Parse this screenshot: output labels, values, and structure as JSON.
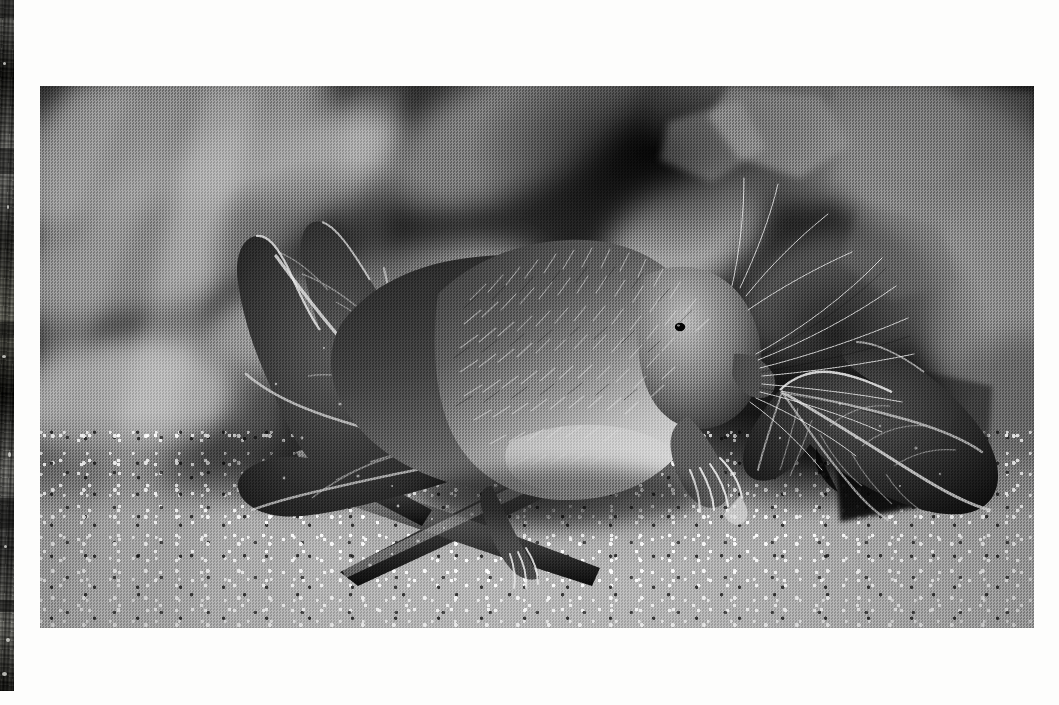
{
  "page": {
    "background_color": "#fdfdfc",
    "width": 1059,
    "height": 705,
    "caption": ""
  },
  "edge_strip": {
    "name": "adjacent-page-photo-sliver",
    "x": 0,
    "y": 0,
    "width": 14,
    "height": 691,
    "description": "Narrow grainy dark-grey vertical strip of a neighbouring photograph bleeding in from the left edge",
    "base_color": "#4a4a48"
  },
  "photo": {
    "title": "Shrew on ivy twig",
    "x": 40,
    "y": 86,
    "width": 994,
    "height": 542,
    "mode": "black-and-white",
    "border_color": "#ffffff",
    "tones": {
      "darkest": "#111111",
      "shadow": "#2a2a2a",
      "midtone": "#7a7a76",
      "highlight": "#c8c8c2",
      "lightest": "#f2f2ee"
    },
    "subject": {
      "animal": "shrew",
      "pose": "climbing along a twig, head lowered to the right, forefoot gripping the branch",
      "fur": "dense spiky grizzled fur, dark dorsal, pale underside",
      "features": [
        "pointed snout",
        "long whiskers",
        "tiny black eye",
        "clawed forefoot",
        "clawed hindfoot"
      ]
    },
    "elements": [
      {
        "name": "background-foliage",
        "description": "out-of-focus ivy leaves and pale diagonal light streaks"
      },
      {
        "name": "dark-shadow-mass",
        "description": "deep black shadow area upper-centre and right"
      },
      {
        "name": "left-ivy-leaf",
        "description": "large sharply-focused ivy leaf with pale veins, lower left"
      },
      {
        "name": "right-ivy-leaf",
        "description": "second ivy leaf with pale veins, lower right"
      },
      {
        "name": "twig",
        "description": "woody diagonal stem running from lower-left to centre-right"
      },
      {
        "name": "ground",
        "description": "bright speckled gravel and concrete surface across the bottom"
      }
    ]
  }
}
